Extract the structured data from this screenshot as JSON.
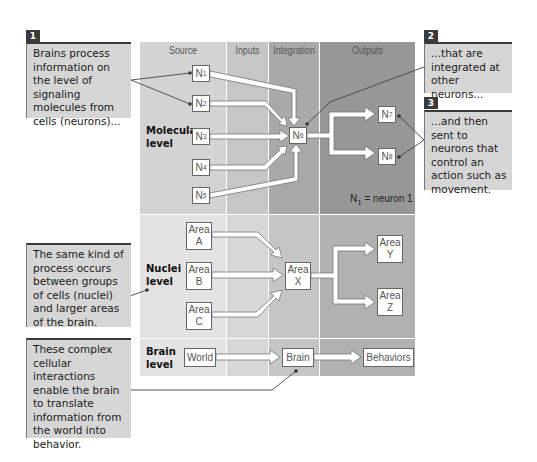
{
  "columns": {
    "source": "Source",
    "inputs": "Inputs",
    "integration": "Integration",
    "outputs": "Outputs"
  },
  "levels": {
    "molecular": [
      "Molecular",
      "level"
    ],
    "nuclei": [
      "Nuclei",
      "level"
    ],
    "brain": [
      "Brain",
      "level"
    ]
  },
  "molecular_nodes": {
    "n1": {
      "base": "N",
      "sub": "1"
    },
    "n2": {
      "base": "N",
      "sub": "2"
    },
    "n3": {
      "base": "N",
      "sub": "3"
    },
    "n4": {
      "base": "N",
      "sub": "4"
    },
    "n5": {
      "base": "N",
      "sub": "5"
    },
    "n6": {
      "base": "N",
      "sub": "6"
    },
    "n7": {
      "base": "N",
      "sub": "7"
    },
    "n8": {
      "base": "N",
      "sub": "8"
    }
  },
  "legend_note": {
    "base": "N",
    "sub": "1",
    "text": " = neuron 1"
  },
  "nuclei_nodes": {
    "a": [
      "Area",
      "A"
    ],
    "b": [
      "Area",
      "B"
    ],
    "c": [
      "Area",
      "C"
    ],
    "x": [
      "Area",
      "X"
    ],
    "y": [
      "Area",
      "Y"
    ],
    "z": [
      "Area",
      "Z"
    ]
  },
  "brain_nodes": {
    "world": "World",
    "brain": "Brain",
    "behaviors": "Behaviors"
  },
  "callouts": [
    {
      "number": "1",
      "text": "Brains process information on the level of signaling molecules from cells (neurons)..."
    },
    {
      "number": "2",
      "text": "...that are integrated at other neurons..."
    },
    {
      "number": "3",
      "text": "...and then sent to neurons that control an action such as movement."
    },
    {
      "number": "",
      "text": "The same kind of process occurs between groups of cells (nuclei) and larger areas of the brain."
    },
    {
      "number": "",
      "text": "These complex cellular interactions enable the brain to translate information from the world into behavior."
    }
  ],
  "colors": {
    "row1": [
      "#d3d3d3",
      "#c6c6c6",
      "#a9a9a9",
      "#979797"
    ],
    "row2": [
      "#e3e3e3",
      "#d7d7d7",
      "#c5c5c5",
      "#b1b1b1"
    ],
    "callout_bg": "#d6d6d6",
    "callout_accent": "#3a3a3a"
  }
}
